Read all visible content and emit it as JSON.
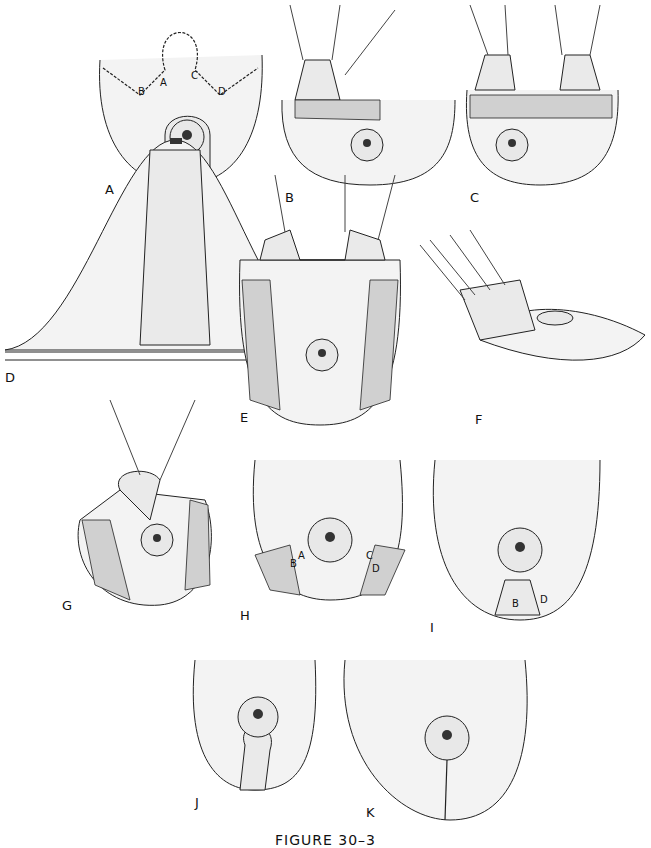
{
  "figure": {
    "caption": "FIGURE 30–3",
    "panels": [
      {
        "id": "A",
        "label": "A",
        "points": [
          "A",
          "B",
          "C",
          "D"
        ]
      },
      {
        "id": "B",
        "label": "B"
      },
      {
        "id": "C",
        "label": "C"
      },
      {
        "id": "D",
        "label": "D"
      },
      {
        "id": "E",
        "label": "E"
      },
      {
        "id": "F",
        "label": "F"
      },
      {
        "id": "G",
        "label": "G"
      },
      {
        "id": "H",
        "label": "H",
        "points": [
          "B",
          "A",
          "C",
          "D"
        ]
      },
      {
        "id": "I",
        "label": "I",
        "points": [
          "B",
          "D"
        ]
      },
      {
        "id": "J",
        "label": "J"
      },
      {
        "id": "K",
        "label": "K"
      }
    ]
  }
}
